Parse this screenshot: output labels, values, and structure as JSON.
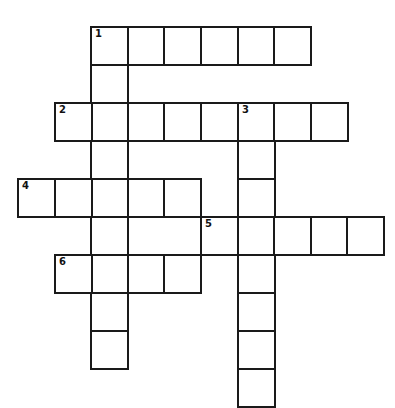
{
  "puzzle": {
    "type": "crossword",
    "cell_size": 36,
    "origin_x": 17,
    "origin_y": 26,
    "border_color": "#1a1a1a",
    "entries": [
      {
        "number": "1",
        "direction": "across",
        "row": 0,
        "col": 2,
        "length": 6
      },
      {
        "number": "1",
        "direction": "down",
        "row": 0,
        "col": 2,
        "length": 9
      },
      {
        "number": "2",
        "direction": "across",
        "row": 2,
        "col": 1,
        "length": 8
      },
      {
        "number": "3",
        "direction": "down",
        "row": 2,
        "col": 6,
        "length": 8
      },
      {
        "number": "4",
        "direction": "across",
        "row": 4,
        "col": 0,
        "length": 5
      },
      {
        "number": "5",
        "direction": "across",
        "row": 5,
        "col": 5,
        "length": 5
      },
      {
        "number": "6",
        "direction": "across",
        "row": 6,
        "col": 1,
        "length": 4
      }
    ],
    "labels": [
      {
        "number": "1",
        "row": 0,
        "col": 2
      },
      {
        "number": "2",
        "row": 2,
        "col": 1
      },
      {
        "number": "3",
        "row": 2,
        "col": 6
      },
      {
        "number": "4",
        "row": 4,
        "col": 0
      },
      {
        "number": "5",
        "row": 5,
        "col": 5
      },
      {
        "number": "6",
        "row": 6,
        "col": 1
      }
    ]
  }
}
